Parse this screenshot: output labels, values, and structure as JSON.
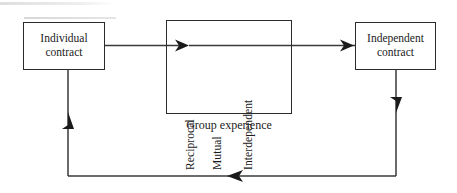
{
  "diagram": {
    "caption": "Group experience",
    "line_color": "#3a3a3a",
    "box_border_color": "#2b2b2b",
    "text_color": "#1b1b1b",
    "background": "#ffffff",
    "nodes": [
      {
        "id": "individual",
        "label": "Individual\ncontract"
      },
      {
        "id": "independent",
        "label": "Independent\ncontract"
      }
    ],
    "group_box": {
      "caption": "Group experience",
      "words": [
        {
          "id": "reciprocal",
          "label": "Reciprocal",
          "orientation": "vertical-bottom-up"
        },
        {
          "id": "mutual",
          "label": "Mutual",
          "orientation": "vertical-bottom-up"
        },
        {
          "id": "interdependent",
          "label": "Interdependent",
          "orientation": "vertical-bottom-up"
        }
      ]
    },
    "connectors": [
      {
        "id": "individual-to-group",
        "from": "individual",
        "to": "group",
        "direction": "right",
        "arrow": true
      },
      {
        "id": "group-to-independent",
        "from": "group",
        "to": "independent",
        "direction": "right",
        "arrow": true
      },
      {
        "id": "independent-down",
        "from": "independent",
        "to": "feedback-line",
        "direction": "down",
        "arrow": true
      },
      {
        "id": "feedback-line",
        "from": "independent",
        "to": "individual",
        "direction": "left",
        "arrow": true
      },
      {
        "id": "feedback-up",
        "from": "feedback-line",
        "to": "individual",
        "direction": "up",
        "arrow": true
      }
    ]
  }
}
